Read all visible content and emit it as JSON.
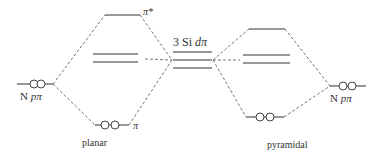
{
  "diagram": {
    "type": "molecular-orbital-energy-diagram",
    "left_orbital": {
      "atom": "N",
      "orbital": "pπ",
      "electrons": 2
    },
    "right_orbital": {
      "atom": "N",
      "orbital": "pπ",
      "electrons": 2
    },
    "center": {
      "label_prefix": "3 Si",
      "label_orbital": "dπ",
      "levels": 3
    },
    "planar": {
      "label": "planar",
      "antibonding_label": "π*",
      "bonding_label": "π",
      "bonding_electrons": 2,
      "nonbonding_levels": 2
    },
    "pyramidal": {
      "label": "pyramidal",
      "bonding_electrons": 2,
      "nonbonding_levels": 2
    },
    "colors": {
      "line": "#333333",
      "dashed": "#555555",
      "background": "#ffffff"
    }
  }
}
